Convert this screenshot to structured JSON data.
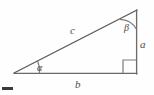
{
  "figure": {
    "type": "geometric-diagram",
    "background_color": "#fefefe",
    "stroke_color": "#5a5a5a",
    "label_color": "#4a4a4a"
  },
  "labels": {
    "hypotenuse": "c",
    "base": "b",
    "vertical_leg": "a",
    "angle_left": "α",
    "angle_top": "β"
  },
  "geometry": {
    "vertices": {
      "left": {
        "x": 14,
        "y": 73
      },
      "top_right": {
        "x": 137,
        "y": 10
      },
      "bottom_right": {
        "x": 137,
        "y": 74
      }
    },
    "right_angle_marker": {
      "x": 123,
      "y": 60,
      "size": 14,
      "at_vertex": "bottom_right"
    },
    "angle_arcs": [
      {
        "name": "alpha-arc",
        "vertex": "left",
        "radius": 26
      },
      {
        "name": "beta-arc",
        "vertex": "top_right",
        "radius": 20
      }
    ]
  },
  "marks": {
    "corner_bar": {
      "x": 2,
      "y": 87,
      "width": 11,
      "height": 3,
      "color": "#3a3a3a"
    }
  }
}
